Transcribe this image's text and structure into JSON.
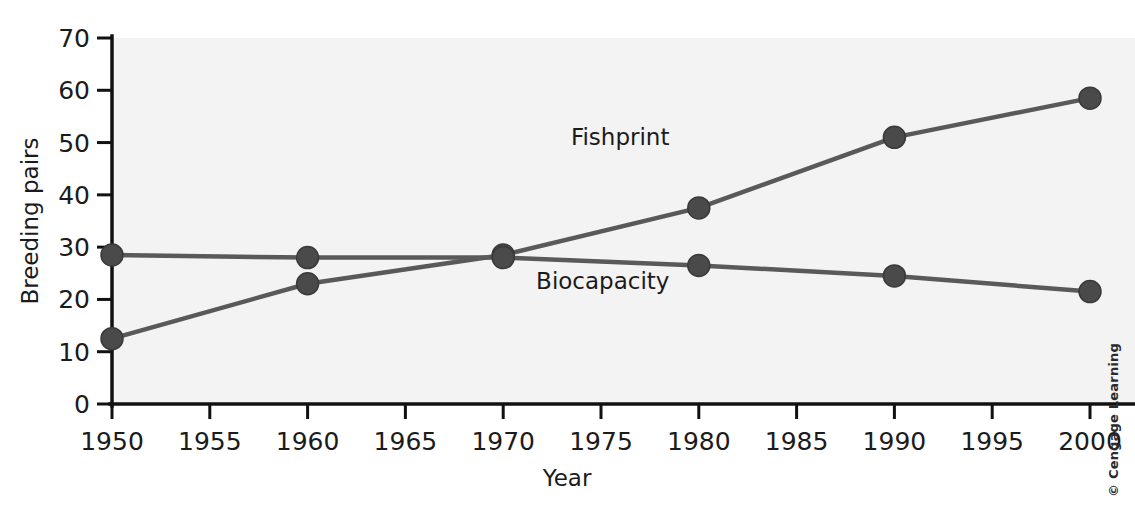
{
  "figure": {
    "credit": "© Cengage Learning",
    "background_color": "#ffffff",
    "plot_background_color": "#f3f3f3",
    "line_color": "#595959",
    "marker_color": "#4a4a4a",
    "axis_color": "#111111"
  },
  "chart_data": {
    "type": "line",
    "title": "",
    "xlabel": "Year",
    "ylabel": "Breeding pairs",
    "x": [
      1950,
      1960,
      1970,
      1980,
      1990,
      2000
    ],
    "xlim": [
      1950,
      2000
    ],
    "ylim": [
      0,
      70
    ],
    "xticks": [
      1950,
      1955,
      1960,
      1965,
      1970,
      1975,
      1980,
      1985,
      1990,
      1995,
      2000
    ],
    "xticklabels": [
      "1950",
      "1955",
      "1960",
      "1965",
      "1970",
      "1975",
      "1980",
      "1985",
      "1990",
      "1995",
      "2000"
    ],
    "yticks": [
      0,
      10,
      20,
      30,
      40,
      50,
      60,
      70
    ],
    "yticklabels": [
      "0",
      "10",
      "20",
      "30",
      "40",
      "50",
      "60",
      "70"
    ],
    "grid": false,
    "legend": "inline-annotations",
    "series": [
      {
        "name": "Fishprint",
        "values": [
          12.5,
          23.0,
          28.5,
          37.5,
          51.0,
          58.5
        ],
        "label_x": 1978.5,
        "label_y": 49.5,
        "color": "#595959"
      },
      {
        "name": "Biocapacity",
        "values": [
          28.5,
          28.0,
          28.0,
          26.5,
          24.5,
          21.5
        ],
        "label_x": 1978.5,
        "label_y": 22.0,
        "color": "#595959"
      }
    ],
    "annotations": [
      {
        "text": "Fishprint",
        "x": 1978.5,
        "y": 49.5
      },
      {
        "text": "Biocapacity",
        "x": 1978.5,
        "y": 22.0
      }
    ]
  }
}
